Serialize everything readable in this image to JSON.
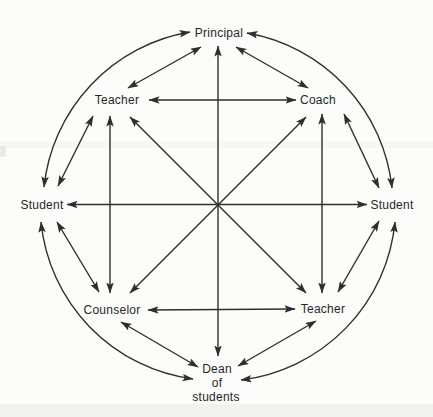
{
  "diagram": {
    "type": "network",
    "arrows": "double-headed",
    "colors": {
      "line": "#2e2e2c",
      "text": "#262626",
      "background": "#fcfcfb"
    },
    "nodes": [
      {
        "id": "principal",
        "label": "Principal",
        "position": "top"
      },
      {
        "id": "coach",
        "label": "Coach",
        "position": "upper-right"
      },
      {
        "id": "student-right",
        "label": "Student",
        "position": "right"
      },
      {
        "id": "teacher-lower-right",
        "label": "Teacher",
        "position": "lower-right"
      },
      {
        "id": "dean-of-students",
        "label": "Dean of students",
        "lines": [
          "Dean",
          "of",
          "students"
        ],
        "position": "bottom"
      },
      {
        "id": "counselor",
        "label": "Counselor",
        "position": "lower-left"
      },
      {
        "id": "student-left",
        "label": "Student",
        "position": "left"
      },
      {
        "id": "teacher-upper-left",
        "label": "Teacher",
        "position": "upper-left"
      }
    ],
    "edges": [
      {
        "from": "principal",
        "to": "teacher-upper-left",
        "shape": "straight"
      },
      {
        "from": "principal",
        "to": "coach",
        "shape": "straight"
      },
      {
        "from": "teacher-upper-left",
        "to": "student-left",
        "shape": "straight"
      },
      {
        "from": "coach",
        "to": "student-right",
        "shape": "straight"
      },
      {
        "from": "student-left",
        "to": "counselor",
        "shape": "straight"
      },
      {
        "from": "student-right",
        "to": "teacher-lower-right",
        "shape": "straight"
      },
      {
        "from": "counselor",
        "to": "dean-of-students",
        "shape": "straight"
      },
      {
        "from": "teacher-lower-right",
        "to": "dean-of-students",
        "shape": "straight"
      },
      {
        "from": "teacher-upper-left",
        "to": "coach",
        "shape": "straight"
      },
      {
        "from": "counselor",
        "to": "teacher-lower-right",
        "shape": "straight"
      },
      {
        "from": "teacher-upper-left",
        "to": "counselor",
        "shape": "straight"
      },
      {
        "from": "coach",
        "to": "teacher-lower-right",
        "shape": "straight"
      },
      {
        "from": "principal",
        "to": "dean-of-students",
        "shape": "straight-through-center"
      },
      {
        "from": "student-left",
        "to": "student-right",
        "shape": "straight-through-center"
      },
      {
        "from": "teacher-upper-left",
        "to": "teacher-lower-right",
        "shape": "straight-through-center"
      },
      {
        "from": "coach",
        "to": "counselor",
        "shape": "straight-through-center"
      },
      {
        "from": "principal",
        "to": "student-left",
        "shape": "outer-arc"
      },
      {
        "from": "principal",
        "to": "student-right",
        "shape": "outer-arc"
      },
      {
        "from": "student-left",
        "to": "dean-of-students",
        "shape": "outer-arc"
      },
      {
        "from": "student-right",
        "to": "dean-of-students",
        "shape": "outer-arc"
      }
    ]
  }
}
